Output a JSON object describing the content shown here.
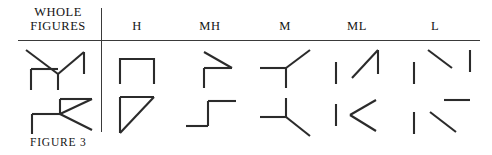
{
  "figure": {
    "caption": "FIGURE 3",
    "stroke_color": "#2b2b2b",
    "rule_color": "#3a3a3a",
    "background": "#ffffff"
  },
  "table": {
    "whole_header": {
      "line1": "WHOLE",
      "line2": "FIGURES"
    },
    "column_headers": [
      {
        "label": "H",
        "name": "column-header-h"
      },
      {
        "label": "MH",
        "name": "column-header-mh"
      },
      {
        "label": "M",
        "name": "column-header-m"
      },
      {
        "label": "ML",
        "name": "column-header-ml"
      },
      {
        "label": "L",
        "name": "column-header-l"
      }
    ],
    "rows": 2,
    "cells": {
      "whole_row1": "whole-figure-row1",
      "whole_row2": "whole-figure-row2",
      "h_row1": "fragment-h-row1",
      "h_row2": "fragment-h-row2",
      "mh_row1": "fragment-mh-row1",
      "mh_row2": "fragment-mh-row2",
      "m_row1": "fragment-m-row1",
      "m_row2": "fragment-m-row2",
      "ml_row1": "fragment-ml-row1",
      "ml_row2": "fragment-ml-row2",
      "l_row1": "fragment-l-row1",
      "l_row2": "fragment-l-row2"
    }
  }
}
